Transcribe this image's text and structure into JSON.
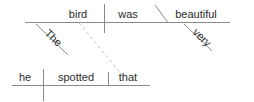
{
  "diagram": {
    "type": "reed-kellogg-sentence-diagram",
    "sentence": "he spotted that the bird was very beautiful",
    "colors": {
      "line": "#8a8a8a",
      "dashed_line": "#c2c2c2",
      "text": "#2b2b2b",
      "background": "#ffffff"
    },
    "clauses": [
      {
        "name": "subordinate-clause",
        "role": "noun clause (direct object)",
        "words": [
          {
            "id": "the",
            "label": "The",
            "role": "article-modifier",
            "orientation": "slanted"
          },
          {
            "id": "bird",
            "label": "bird",
            "role": "subject",
            "orientation": "horizontal"
          },
          {
            "id": "was",
            "label": "was",
            "role": "linking-verb",
            "orientation": "horizontal"
          },
          {
            "id": "beautiful",
            "label": "beautiful",
            "role": "predicate-adjective",
            "orientation": "horizontal"
          },
          {
            "id": "very",
            "label": "very",
            "role": "adverb-modifier",
            "orientation": "slanted"
          }
        ]
      },
      {
        "name": "main-clause",
        "role": "independent clause",
        "words": [
          {
            "id": "he",
            "label": "he",
            "role": "subject",
            "orientation": "horizontal"
          },
          {
            "id": "spotted",
            "label": "spotted",
            "role": "verb",
            "orientation": "horizontal"
          },
          {
            "id": "that",
            "label": "that",
            "role": "subordinator",
            "orientation": "horizontal"
          }
        ]
      }
    ],
    "connector": {
      "name": "clause-connector",
      "style": "dashed",
      "from": "that",
      "to": "bird"
    }
  }
}
